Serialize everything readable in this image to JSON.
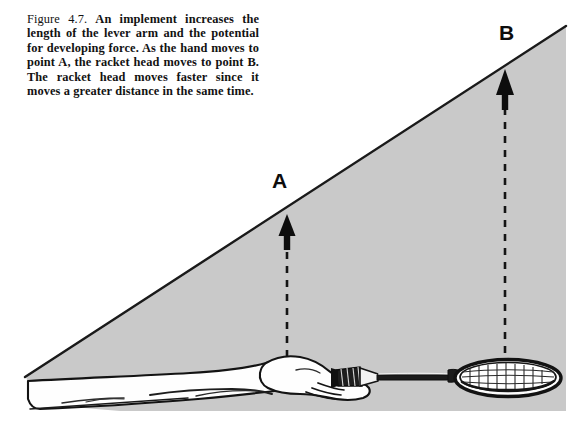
{
  "figure": {
    "number": "Figure 4.7.",
    "caption": "An implement increases the length of the lever arm and the potential for developing force. As the hand moves to point A, the racket head moves to point B. The racket head moves faster since it moves a greater distance in the same time.",
    "labels": {
      "point_a": "A",
      "point_b": "B"
    },
    "colors": {
      "shaded_region": "#c9c9c9",
      "ink": "#111111",
      "background": "#ffffff",
      "limb_fill": "#fdfdfd"
    },
    "elements": {
      "shaded_wedge": "swing-arc-wedge",
      "arrow_a": "displacement-arrow-a",
      "arrow_b": "displacement-arrow-b",
      "dashed_line_a": "dashed-guide-a",
      "dashed_line_b": "dashed-guide-b",
      "arm": "forearm-drawing",
      "hand": "hand-grip-drawing",
      "racket": "tennis-racket-drawing",
      "racket_head": "racket-head-strings"
    }
  }
}
